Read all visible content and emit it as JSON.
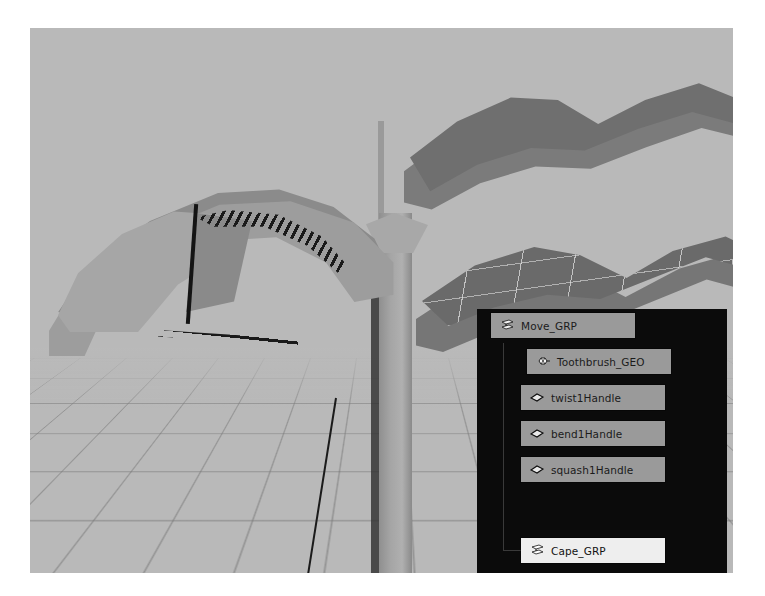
{
  "app": {
    "name": "Maya Viewport",
    "viewport_background": "#b9b9b9",
    "panel_background": "#0b0b0b",
    "row_background": "#9a9a9a",
    "row_selected_background": "#eeeeee",
    "text_color": "#1b1b1b"
  },
  "viewport": {
    "objects": [
      {
        "name": "toothbrush-head",
        "label": "Toothbrush head (bent)"
      },
      {
        "name": "toothbrush-handle",
        "label": "Toothbrush handle"
      },
      {
        "name": "cape-upper",
        "label": "Cape mesh (upper)"
      },
      {
        "name": "cape-lower",
        "label": "Cape mesh (lower, wireframe)"
      },
      {
        "name": "grid-floor",
        "label": "Perspective grid floor"
      }
    ]
  },
  "outliner": {
    "title": "Outliner",
    "items": [
      {
        "label": "Move_GRP",
        "icon": "transform-group-icon",
        "indent": 0,
        "selected": false
      },
      {
        "label": "Toothbrush_GEO",
        "icon": "mesh-icon",
        "indent": 1,
        "selected": false
      },
      {
        "label": "twist1Handle",
        "icon": "deformer-handle-icon",
        "indent": 1,
        "selected": false
      },
      {
        "label": "bend1Handle",
        "icon": "deformer-handle-icon",
        "indent": 1,
        "selected": false
      },
      {
        "label": "squash1Handle",
        "icon": "deformer-handle-icon",
        "indent": 1,
        "selected": false
      },
      {
        "label": "Cape_GRP",
        "icon": "transform-group-icon",
        "indent": 1,
        "selected": true
      },
      {
        "label": "Cape_GEO",
        "icon": "mesh-icon",
        "indent": 2,
        "selected": false
      }
    ]
  }
}
